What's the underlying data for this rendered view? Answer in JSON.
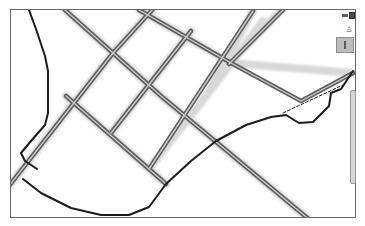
{
  "map": {
    "background": "#ffffff",
    "frame_color": "#6a6a6a",
    "road_color": "#5e5e5e",
    "road_fill": "#c9c9c9",
    "boundary_color": "#1c1c1c"
  },
  "controls": {
    "layer_toggle": {
      "icon": "layers-icon"
    },
    "street_view": {
      "icon": "person-icon",
      "glyph": "♙"
    },
    "zoom_slider": {
      "icon": "zoom-handle-icon"
    },
    "scrollbar": {
      "icon": "vertical-scrollbar"
    }
  }
}
